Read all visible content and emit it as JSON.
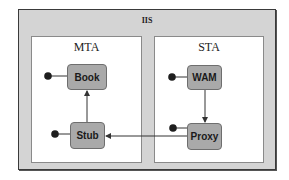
{
  "diagram": {
    "container": {
      "label": "IIS"
    },
    "panels": [
      {
        "id": "mta",
        "label": "MTA"
      },
      {
        "id": "sta",
        "label": "STA"
      }
    ],
    "nodes": [
      {
        "id": "book",
        "label": "Book",
        "panel": "MTA",
        "has_interface_lollipop": true
      },
      {
        "id": "stub",
        "label": "Stub",
        "panel": "MTA",
        "has_interface_lollipop": true
      },
      {
        "id": "wam",
        "label": "WAM",
        "panel": "STA",
        "has_interface_lollipop": true
      },
      {
        "id": "proxy",
        "label": "Proxy",
        "panel": "STA",
        "has_interface_lollipop": true
      }
    ],
    "edges": [
      {
        "from": "WAM",
        "to": "Proxy",
        "direction": "down"
      },
      {
        "from": "Proxy",
        "to": "Stub",
        "direction": "left"
      },
      {
        "from": "Stub",
        "to": "Book",
        "direction": "up"
      }
    ],
    "colors": {
      "container_fill": "#d4d4d4",
      "panel_fill": "#ffffff",
      "node_fill": "#a9a9a9",
      "line": "#333333"
    }
  }
}
